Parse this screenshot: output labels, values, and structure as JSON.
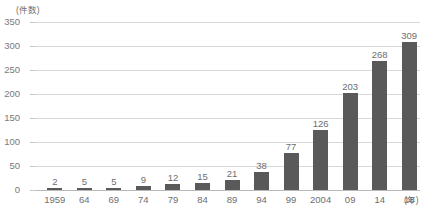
{
  "chart_data": {
    "type": "bar",
    "title": "",
    "xlabel": "(年)",
    "ylabel": "(件数)",
    "ylim": [
      0,
      350
    ],
    "ytick_step": 50,
    "yticks": [
      "350",
      "300",
      "250",
      "200",
      "150",
      "100",
      "50",
      "0"
    ],
    "grid": true,
    "legend": "none",
    "categories": [
      "1959",
      "64",
      "69",
      "74",
      "79",
      "84",
      "89",
      "94",
      "99",
      "2004",
      "09",
      "14",
      "18"
    ],
    "values": [
      2,
      5,
      5,
      9,
      12,
      15,
      21,
      38,
      77,
      126,
      203,
      268,
      309
    ],
    "value_labels": [
      "2",
      "5",
      "5",
      "9",
      "12",
      "15",
      "21",
      "38",
      "77",
      "126",
      "203",
      "268",
      "309"
    ],
    "bar_color": "#595959",
    "gridline_color": "#d8d8d8",
    "axis_color": "#b8b8b8",
    "text_color": "#6e6e6e"
  }
}
